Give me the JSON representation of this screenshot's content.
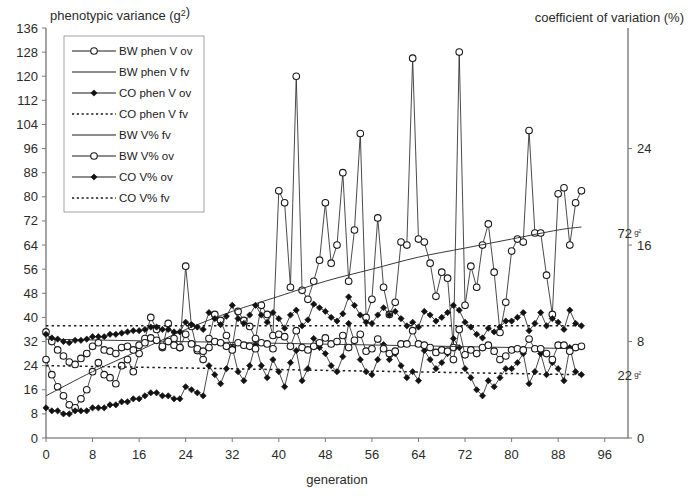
{
  "chart_data": {
    "type": "line",
    "title": "",
    "left_axis_title": "phenotypic variance (g²)",
    "right_axis_title": "coefficient of variation (%)",
    "xlabel": "generation",
    "ylabel": "phenotypic variance (g²)",
    "xlim": [
      0,
      100
    ],
    "ylim": [
      0,
      136
    ],
    "y2lim": [
      0,
      34
    ],
    "xticks": [
      0,
      8,
      16,
      24,
      32,
      40,
      48,
      56,
      64,
      72,
      80,
      88,
      96
    ],
    "yticks": [
      0,
      8,
      16,
      24,
      32,
      40,
      48,
      56,
      64,
      72,
      80,
      88,
      96,
      104,
      112,
      120,
      128,
      136
    ],
    "y2ticks": [
      0,
      8,
      16,
      24
    ],
    "grid": false,
    "legend_position": "top-left",
    "annotations": [
      {
        "name": "bw-trend-label",
        "text": "72",
        "sup": "g²",
        "x": 97.5,
        "y": 68
      },
      {
        "name": "co-trend-label",
        "text": "22",
        "sup": "g²",
        "x": 97.5,
        "y": 21
      }
    ],
    "series": [
      {
        "name": "BW phen V ov",
        "axis": "left",
        "marker": "open-circle",
        "linestyle": "solid",
        "x": [
          0,
          1,
          2,
          3,
          4,
          5,
          6,
          7,
          8,
          9,
          10,
          11,
          12,
          13,
          14,
          15,
          16,
          17,
          18,
          19,
          20,
          21,
          22,
          23,
          24,
          25,
          26,
          27,
          28,
          29,
          30,
          31,
          32,
          33,
          34,
          35,
          36,
          37,
          38,
          39,
          40,
          41,
          42,
          43,
          44,
          45,
          46,
          47,
          48,
          49,
          50,
          51,
          52,
          53,
          54,
          55,
          56,
          57,
          58,
          59,
          60,
          61,
          62,
          63,
          64,
          65,
          66,
          67,
          68,
          69,
          70,
          71,
          72,
          73,
          74,
          75,
          76,
          77,
          78,
          79,
          80,
          81,
          82,
          83,
          84,
          85,
          86,
          87,
          88,
          89,
          90,
          91,
          92
        ],
        "values": [
          26,
          21,
          17,
          14,
          11,
          10,
          13,
          16,
          22,
          25,
          21,
          20,
          18,
          24,
          26,
          22,
          28,
          33,
          40,
          36,
          30,
          38,
          33,
          30,
          57,
          37,
          29,
          26,
          33,
          41,
          39,
          34,
          30,
          42,
          39,
          37,
          33,
          44,
          41,
          34,
          82,
          78,
          50,
          120,
          49,
          46,
          52,
          59,
          78,
          58,
          64,
          88,
          52,
          69,
          101,
          40,
          46,
          73,
          50,
          41,
          45,
          65,
          64,
          126,
          66,
          65,
          58,
          47,
          55,
          53,
          30,
          128,
          44,
          57,
          50,
          64,
          71,
          55,
          35,
          45,
          62,
          66,
          65,
          102,
          68,
          68,
          54,
          41,
          81,
          83,
          64,
          78,
          82
        ]
      },
      {
        "name": "BW phen V fv",
        "axis": "left",
        "marker": "none",
        "linestyle": "solid",
        "x": [
          0,
          8,
          16,
          24,
          32,
          40,
          48,
          56,
          64,
          72,
          80,
          88,
          92
        ],
        "values": [
          14,
          22,
          29,
          36,
          42,
          47,
          52,
          56,
          60,
          63,
          66,
          69,
          70
        ]
      },
      {
        "name": "CO phen V ov",
        "axis": "left",
        "marker": "filled-diamond",
        "linestyle": "solid",
        "x": [
          0,
          1,
          2,
          3,
          4,
          5,
          6,
          7,
          8,
          9,
          10,
          11,
          12,
          13,
          14,
          15,
          16,
          17,
          18,
          19,
          20,
          21,
          22,
          23,
          24,
          25,
          26,
          27,
          28,
          29,
          30,
          31,
          32,
          33,
          34,
          35,
          36,
          37,
          38,
          39,
          40,
          41,
          42,
          43,
          44,
          45,
          46,
          47,
          48,
          49,
          50,
          51,
          52,
          53,
          54,
          55,
          56,
          57,
          58,
          59,
          60,
          61,
          62,
          63,
          64,
          65,
          66,
          67,
          68,
          69,
          70,
          71,
          72,
          73,
          74,
          75,
          76,
          77,
          78,
          79,
          80,
          81,
          82,
          83,
          84,
          85,
          86,
          87,
          88,
          89,
          90,
          91,
          92
        ],
        "values": [
          10,
          9,
          9,
          8,
          8,
          9,
          9,
          9,
          10,
          10,
          10,
          11,
          11,
          12,
          12,
          13,
          13,
          14,
          15,
          15,
          14,
          14,
          13,
          13,
          17,
          16,
          15,
          14,
          24,
          21,
          18,
          23,
          30,
          22,
          19,
          24,
          31,
          24,
          20,
          26,
          22,
          17,
          25,
          29,
          19,
          23,
          33,
          30,
          28,
          24,
          22,
          27,
          38,
          32,
          26,
          22,
          21,
          26,
          31,
          26,
          28,
          24,
          20,
          22,
          19,
          29,
          26,
          23,
          25,
          28,
          33,
          30,
          23,
          20,
          16,
          14,
          19,
          17,
          20,
          23,
          23,
          25,
          28,
          18,
          22,
          28,
          21,
          25,
          23,
          19,
          30,
          22,
          21
        ]
      },
      {
        "name": "CO phen V fv",
        "axis": "left",
        "marker": "none",
        "linestyle": "dotted",
        "x": [
          0,
          92
        ],
        "values": [
          24,
          21
        ]
      },
      {
        "name": "BW V% fv",
        "axis": "right",
        "marker": "none",
        "linestyle": "solid",
        "x": [
          0,
          92
        ],
        "values": [
          8.2,
          7.4
        ]
      },
      {
        "name": "BW V% ov",
        "axis": "right",
        "marker": "open-circle",
        "linestyle": "solid",
        "x": [
          0,
          1,
          2,
          3,
          4,
          5,
          6,
          7,
          8,
          9,
          10,
          11,
          12,
          13,
          14,
          15,
          16,
          17,
          18,
          19,
          20,
          21,
          22,
          23,
          24,
          25,
          26,
          27,
          28,
          29,
          30,
          31,
          32,
          33,
          34,
          35,
          36,
          37,
          38,
          39,
          40,
          41,
          42,
          43,
          44,
          45,
          46,
          47,
          48,
          49,
          50,
          51,
          52,
          53,
          54,
          55,
          56,
          57,
          58,
          59,
          60,
          61,
          62,
          63,
          64,
          65,
          66,
          67,
          68,
          69,
          70,
          71,
          72,
          73,
          74,
          75,
          76,
          77,
          78,
          79,
          80,
          81,
          82,
          83,
          84,
          85,
          86,
          87,
          88,
          89,
          90,
          91,
          92
        ],
        "values": [
          8.8,
          8.0,
          7.3,
          6.8,
          6.3,
          6.1,
          6.6,
          7.0,
          7.6,
          7.9,
          7.3,
          7.2,
          7.0,
          7.5,
          7.6,
          7.3,
          7.7,
          7.9,
          8.3,
          8.1,
          7.6,
          8.0,
          7.7,
          7.5,
          8.6,
          7.8,
          7.4,
          7.2,
          7.5,
          8.0,
          7.9,
          7.6,
          7.3,
          7.9,
          7.7,
          7.6,
          7.4,
          7.9,
          7.8,
          7.4,
          8.6,
          8.4,
          7.6,
          8.9,
          7.5,
          7.3,
          7.6,
          7.9,
          8.3,
          7.8,
          8.0,
          8.5,
          7.5,
          8.1,
          8.6,
          7.2,
          7.4,
          8.2,
          7.4,
          7.0,
          7.2,
          7.8,
          7.8,
          8.9,
          7.8,
          7.7,
          7.5,
          7.1,
          7.3,
          7.2,
          6.5,
          9.0,
          6.9,
          7.3,
          7.0,
          7.5,
          7.7,
          7.2,
          6.5,
          6.8,
          7.3,
          7.4,
          7.3,
          8.2,
          7.4,
          7.4,
          7.0,
          6.5,
          7.7,
          7.7,
          7.2,
          7.5,
          7.6
        ]
      },
      {
        "name": "CO V% ov",
        "axis": "right",
        "marker": "filled-diamond",
        "linestyle": "solid",
        "x": [
          0,
          1,
          2,
          3,
          4,
          5,
          6,
          7,
          8,
          9,
          10,
          11,
          12,
          13,
          14,
          15,
          16,
          17,
          18,
          19,
          20,
          21,
          22,
          23,
          24,
          25,
          26,
          27,
          28,
          29,
          30,
          31,
          32,
          33,
          34,
          35,
          36,
          37,
          38,
          39,
          40,
          41,
          42,
          43,
          44,
          45,
          46,
          47,
          48,
          49,
          50,
          51,
          52,
          53,
          54,
          55,
          56,
          57,
          58,
          59,
          60,
          61,
          62,
          63,
          64,
          65,
          66,
          67,
          68,
          69,
          70,
          71,
          72,
          73,
          74,
          75,
          76,
          77,
          78,
          79,
          80,
          81,
          82,
          83,
          84,
          85,
          86,
          87,
          88,
          89,
          90,
          91,
          92
        ],
        "values": [
          8.6,
          8.3,
          8.2,
          8.0,
          7.9,
          8.1,
          8.1,
          8.2,
          8.4,
          8.4,
          8.4,
          8.6,
          8.6,
          8.7,
          8.8,
          8.9,
          8.9,
          9.0,
          9.2,
          9.2,
          9.0,
          9.0,
          8.8,
          8.8,
          9.6,
          9.4,
          9.2,
          9.0,
          10.4,
          9.9,
          9.4,
          10.1,
          11.0,
          9.9,
          9.5,
          10.2,
          11.0,
          10.2,
          9.6,
          10.4,
          9.9,
          9.1,
          10.2,
          10.6,
          9.3,
          9.8,
          11.1,
          10.8,
          10.5,
          10.0,
          9.7,
          10.3,
          11.7,
          11.0,
          10.2,
          9.6,
          9.5,
          10.2,
          10.8,
          10.2,
          10.5,
          9.9,
          9.3,
          9.6,
          9.2,
          10.5,
          10.2,
          9.7,
          10.0,
          10.4,
          11.0,
          10.6,
          9.6,
          9.2,
          8.6,
          8.3,
          9.1,
          8.8,
          9.2,
          9.7,
          9.7,
          10.0,
          10.4,
          8.9,
          9.5,
          10.4,
          9.3,
          9.9,
          9.6,
          9.0,
          10.6,
          9.5,
          9.3
        ]
      },
      {
        "name": "CO V% fv",
        "axis": "right",
        "marker": "none",
        "linestyle": "dotted",
        "x": [
          0,
          92
        ],
        "values": [
          9.3,
          9.3
        ]
      }
    ]
  },
  "legend": {
    "items": [
      {
        "label": "BW phen V ov",
        "marker": "open-circle",
        "linestyle": "solid"
      },
      {
        "label": "BW phen V fv",
        "marker": "none",
        "linestyle": "solid"
      },
      {
        "label": "CO phen V ov",
        "marker": "filled-diamond",
        "linestyle": "solid"
      },
      {
        "label": "CO phen V fv",
        "marker": "none",
        "linestyle": "dotted"
      },
      {
        "label": "BW V% fv",
        "marker": "none",
        "linestyle": "solid"
      },
      {
        "label": "BW V% ov",
        "marker": "open-circle",
        "linestyle": "solid"
      },
      {
        "label": "CO V% ov",
        "marker": "filled-diamond",
        "linestyle": "solid"
      },
      {
        "label": "CO V% fv",
        "marker": "none",
        "linestyle": "dotted"
      }
    ]
  },
  "colors": {
    "line": "#2a2a2a",
    "axis": "#5a5a5a",
    "text": "#2b2b2b",
    "background": "#ffffff"
  }
}
